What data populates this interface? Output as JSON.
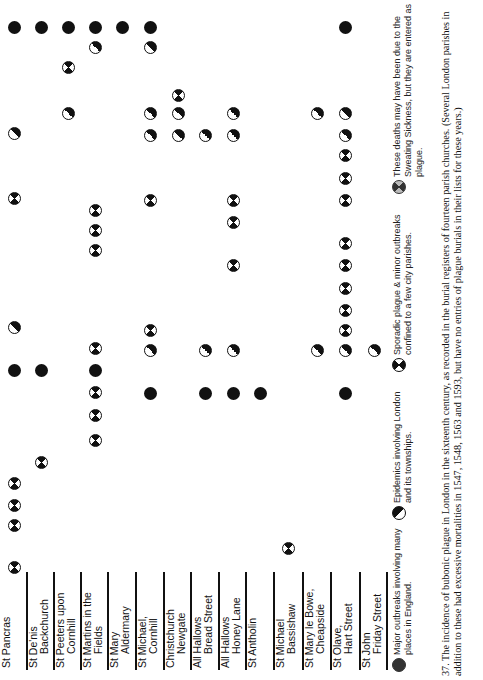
{
  "chart_data": {
    "type": "table",
    "parishes": [
      "St Pancras",
      "St De'nis Backchurch",
      "St Peeters upon Cornhill",
      "St Martins in the Fields",
      "St Mary Aldermary",
      "St Michael, Cornhill",
      "Christchurch Newgate",
      "All Hallows Bread Street",
      "All Hallows Honey Lane",
      "St Antholin",
      "St Michael Bassishaw",
      "St Mary le Bowe, Cheapside",
      "St Olave, Hart Street",
      "St John Friday Street"
    ],
    "symbol_types": {
      "filled": "Major outbreaks involving many places in England.",
      "half": "Epidemics involving London and its townships.",
      "cross": "Sporadic plague & minor outbreaks confined to a few city parishes.",
      "sweat": "These deaths may have been due to the Sweating Sickness, but they are entered as plague."
    },
    "note": "Columns = parishes (left to right); vertical position = chronological event row",
    "marks": [
      {
        "col": 0,
        "y": 27,
        "t": "filled"
      },
      {
        "col": 1,
        "y": 27,
        "t": "filled"
      },
      {
        "col": 2,
        "y": 27,
        "t": "filled"
      },
      {
        "col": 3,
        "y": 27,
        "t": "filled"
      },
      {
        "col": 4,
        "y": 27,
        "t": "filled"
      },
      {
        "col": 5,
        "y": 27,
        "t": "filled"
      },
      {
        "col": 12,
        "y": 27,
        "t": "filled"
      },
      {
        "col": 3,
        "y": 47,
        "t": "half"
      },
      {
        "col": 5,
        "y": 47,
        "t": "half"
      },
      {
        "col": 2,
        "y": 67,
        "t": "cross"
      },
      {
        "col": 6,
        "y": 95,
        "t": "cross"
      },
      {
        "col": 2,
        "y": 113,
        "t": "half"
      },
      {
        "col": 5,
        "y": 113,
        "t": "half"
      },
      {
        "col": 6,
        "y": 113,
        "t": "half"
      },
      {
        "col": 8,
        "y": 113,
        "t": "half"
      },
      {
        "col": 11,
        "y": 113,
        "t": "half"
      },
      {
        "col": 12,
        "y": 113,
        "t": "half"
      },
      {
        "col": 0,
        "y": 133,
        "t": "half"
      },
      {
        "col": 5,
        "y": 135,
        "t": "half"
      },
      {
        "col": 6,
        "y": 135,
        "t": "half"
      },
      {
        "col": 7,
        "y": 135,
        "t": "half"
      },
      {
        "col": 8,
        "y": 135,
        "t": "half"
      },
      {
        "col": 12,
        "y": 135,
        "t": "half"
      },
      {
        "col": 12,
        "y": 155,
        "t": "cross"
      },
      {
        "col": 12,
        "y": 178,
        "t": "cross"
      },
      {
        "col": 0,
        "y": 198,
        "t": "cross"
      },
      {
        "col": 5,
        "y": 200,
        "t": "cross"
      },
      {
        "col": 8,
        "y": 200,
        "t": "cross"
      },
      {
        "col": 12,
        "y": 200,
        "t": "cross"
      },
      {
        "col": 3,
        "y": 210,
        "t": "cross"
      },
      {
        "col": 8,
        "y": 222,
        "t": "cross"
      },
      {
        "col": 3,
        "y": 230,
        "t": "cross"
      },
      {
        "col": 12,
        "y": 243,
        "t": "cross"
      },
      {
        "col": 3,
        "y": 250,
        "t": "cross"
      },
      {
        "col": 8,
        "y": 265,
        "t": "cross"
      },
      {
        "col": 12,
        "y": 265,
        "t": "cross"
      },
      {
        "col": 12,
        "y": 288,
        "t": "cross"
      },
      {
        "col": 12,
        "y": 310,
        "t": "cross"
      },
      {
        "col": 0,
        "y": 327,
        "t": "half"
      },
      {
        "col": 5,
        "y": 330,
        "t": "cross"
      },
      {
        "col": 12,
        "y": 330,
        "t": "cross"
      },
      {
        "col": 3,
        "y": 348,
        "t": "cross"
      },
      {
        "col": 5,
        "y": 350,
        "t": "half"
      },
      {
        "col": 7,
        "y": 350,
        "t": "half"
      },
      {
        "col": 8,
        "y": 350,
        "t": "half"
      },
      {
        "col": 11,
        "y": 350,
        "t": "half"
      },
      {
        "col": 12,
        "y": 350,
        "t": "half"
      },
      {
        "col": 13,
        "y": 350,
        "t": "half"
      },
      {
        "col": 0,
        "y": 370,
        "t": "filled"
      },
      {
        "col": 1,
        "y": 370,
        "t": "filled"
      },
      {
        "col": 3,
        "y": 370,
        "t": "filled"
      },
      {
        "col": 5,
        "y": 393,
        "t": "filled"
      },
      {
        "col": 7,
        "y": 393,
        "t": "filled"
      },
      {
        "col": 8,
        "y": 393,
        "t": "filled"
      },
      {
        "col": 9,
        "y": 393,
        "t": "filled"
      },
      {
        "col": 12,
        "y": 393,
        "t": "filled"
      },
      {
        "col": 3,
        "y": 392,
        "t": "cross"
      },
      {
        "col": 3,
        "y": 415,
        "t": "cross"
      },
      {
        "col": 3,
        "y": 440,
        "t": "cross"
      },
      {
        "col": 1,
        "y": 462,
        "t": "cross"
      },
      {
        "col": 0,
        "y": 483,
        "t": "cross"
      },
      {
        "col": 0,
        "y": 505,
        "t": "cross"
      },
      {
        "col": 0,
        "y": 525,
        "t": "cross"
      },
      {
        "col": 10,
        "y": 548,
        "t": "cross"
      },
      {
        "col": 0,
        "y": 567,
        "t": "cross"
      }
    ]
  },
  "col_x": [
    14,
    41,
    68,
    95,
    122,
    150,
    178,
    205,
    233,
    260,
    288,
    317,
    345,
    374
  ],
  "parish_labels": [
    [
      "St Pancras",
      ""
    ],
    [
      "St De'nis",
      "Backchurch"
    ],
    [
      "St Peeters upon",
      "Cornhill"
    ],
    [
      "St Martins in the",
      "Fields"
    ],
    [
      "St Mary",
      "Aldermary"
    ],
    [
      "St Michael,",
      "Cornhill"
    ],
    [
      "Christchurch",
      "Newgate"
    ],
    [
      "All Hallows",
      "Bread Street"
    ],
    [
      "All Hallows",
      "Honey Lane"
    ],
    [
      "St Antholin",
      ""
    ],
    [
      "St Michael",
      "Bassishaw"
    ],
    [
      "St Mary le Bowe,",
      "Cheapside"
    ],
    [
      "St Olave,",
      "Hart Street"
    ],
    [
      "St John",
      "Friday Street"
    ]
  ],
  "legend": [
    {
      "symbol": "filled",
      "text": "Major outbreaks involving many places in England."
    },
    {
      "symbol": "half",
      "text": "Epidemics involving London and its townships."
    },
    {
      "symbol": "cross",
      "text": "Sporadic plague & minor outbreaks confined to a few city parishes."
    },
    {
      "symbol": "sweat",
      "text": "These deaths may have been due to the Sweating Sickness, but they are entered as plague."
    }
  ],
  "caption": "37. The incidence of bubonic plague in London in the sixteenth century, as recorded in the burial registers of fourteen parish churches. (Several London parishes in addition to these had excessive mortalities in 1547, 1548, 1563 and 1593, but have no entries of plague burials in their lists for these years.)"
}
